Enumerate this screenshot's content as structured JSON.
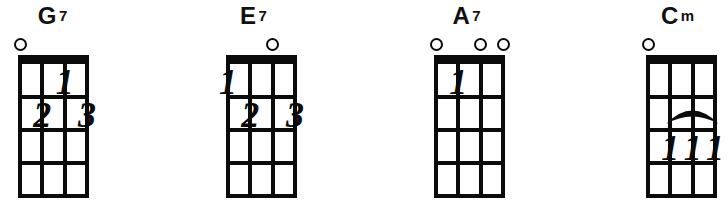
{
  "instrument_diagram": {
    "strings_per_chord": 4,
    "frets_shown": 4,
    "colors": {
      "ink": "#0b0b0b",
      "background": "#ffffff"
    }
  },
  "chords": [
    {
      "label": "G7",
      "letter": "G",
      "suffix": "7",
      "open_strings": [
        1
      ],
      "fingers": [
        {
          "string": 3,
          "fret": 1,
          "text": "1"
        },
        {
          "string": 2,
          "fret": 2,
          "text": "2"
        },
        {
          "string": 4,
          "fret": 2,
          "text": "3"
        }
      ],
      "barre": null
    },
    {
      "label": "E7",
      "letter": "E",
      "suffix": "7",
      "open_strings": [
        3
      ],
      "fingers": [
        {
          "string": 1,
          "fret": 1,
          "text": "1"
        },
        {
          "string": 2,
          "fret": 2,
          "text": "2"
        },
        {
          "string": 4,
          "fret": 2,
          "text": "3"
        }
      ],
      "barre": null
    },
    {
      "label": "A7",
      "letter": "A",
      "suffix": "7",
      "open_strings": [
        1,
        3,
        4
      ],
      "fingers": [
        {
          "string": 2,
          "fret": 1,
          "text": "1"
        }
      ],
      "barre": null
    },
    {
      "label": "Cm",
      "letter": "C",
      "suffix": "m",
      "open_strings": [
        1
      ],
      "fingers": [
        {
          "string": 2,
          "fret": 3,
          "text": "1"
        },
        {
          "string": 3,
          "fret": 3,
          "text": "1"
        },
        {
          "string": 4,
          "fret": 3,
          "text": "1"
        }
      ],
      "barre": {
        "from_string": 2,
        "to_string": 4,
        "fret": 3
      }
    }
  ]
}
